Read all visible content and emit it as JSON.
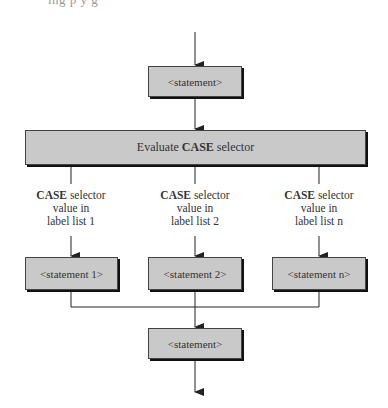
{
  "clipped_text": "ing  p  y  g",
  "top_statement": "<statement>",
  "evaluate": {
    "prefix": "Evaluate ",
    "keyword": "CASE",
    "suffix": " selector"
  },
  "branches": [
    {
      "keyword": "CASE",
      "line1": " selector",
      "line2": "value in",
      "line3": "label list 1",
      "statement": "<statement 1>"
    },
    {
      "keyword": "CASE",
      "line1": " selector",
      "line2": "value in",
      "line3": "label list 2",
      "statement": "<statement 2>"
    },
    {
      "keyword": "CASE",
      "line1": " selector",
      "line2": "value in",
      "line3": "label list n",
      "statement": "<statement n>"
    }
  ],
  "bottom_statement": "<statement>",
  "colors": {
    "box_fill": "#c9c9c9",
    "line": "#222222"
  }
}
